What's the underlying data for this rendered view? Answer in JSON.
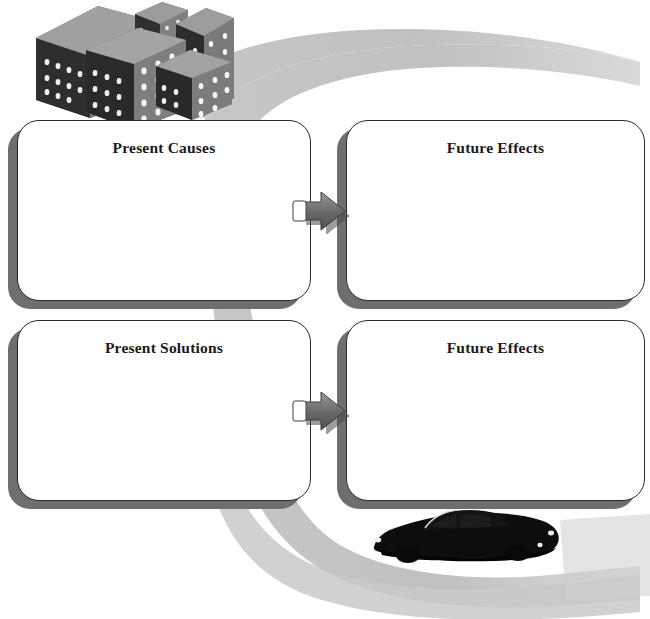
{
  "page": {
    "background_color": "#ffffff"
  },
  "theme": {
    "box_fill": "#ffffff",
    "box_border": "#2b2b2b",
    "box_shadow": "#6e6e6e",
    "road_color": "#bcbcbc",
    "arrow_dark": "#5a5a5a",
    "arrow_light": "#8f8f8f",
    "arrow_tail_fill": "#ffffff",
    "building_front": "#2a2a2a",
    "building_side": "#7d7d7d",
    "building_top": "#9b9b9b",
    "window_color": "#f2f2f2",
    "car_color": "#101010",
    "text_color": "#1a1a1a"
  },
  "boxes": [
    {
      "id": "present-causes",
      "label": "Present Causes",
      "row": 1,
      "column": 1,
      "body_text": ""
    },
    {
      "id": "future-effects-1",
      "label": "Future Effects",
      "row": 1,
      "column": 2,
      "body_text": ""
    },
    {
      "id": "present-solutions",
      "label": "Present Solutions",
      "row": 2,
      "column": 1,
      "body_text": ""
    },
    {
      "id": "future-effects-2",
      "label": "Future Effects",
      "row": 2,
      "column": 2,
      "body_text": ""
    }
  ],
  "connectors": [
    {
      "id": "arrow-causes-to-effects",
      "direction": "right",
      "from": "present-causes",
      "to": "future-effects-1"
    },
    {
      "id": "arrow-solutions-to-effects",
      "direction": "right",
      "from": "present-solutions",
      "to": "future-effects-2"
    }
  ],
  "decorations": [
    {
      "id": "city-buildings",
      "name": "city-buildings-illustration",
      "position": "top-left",
      "description": "cluster of five isometric dark city buildings with lit windows"
    },
    {
      "id": "winding-road",
      "name": "winding-road-illustration",
      "position": "background",
      "description": "light gray curving road sweeping from upper right down to lower right behind the boxes"
    },
    {
      "id": "black-car",
      "name": "black-car-illustration",
      "position": "bottom-right",
      "description": "dark muscle car seen in profile facing left, sitting on the road"
    }
  ]
}
